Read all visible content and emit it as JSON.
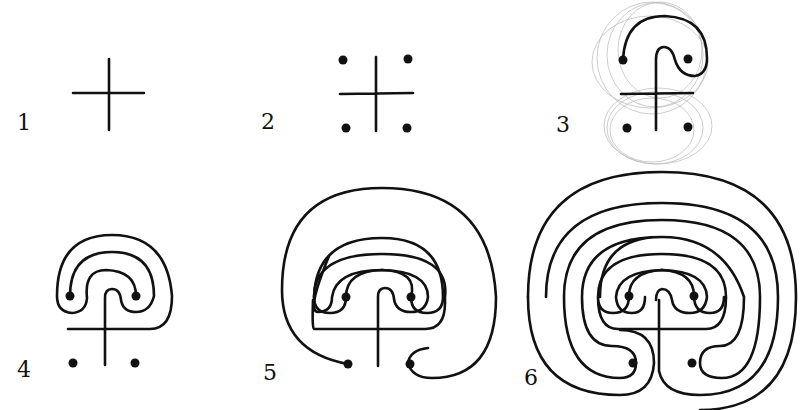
{
  "figure": {
    "ink_color": "#111111",
    "sketch_color": "#b8b8b8",
    "background": "#ffffff"
  },
  "steps": [
    {
      "number": "1",
      "description": "cross"
    },
    {
      "number": "2",
      "description": "cross with four corner dots"
    },
    {
      "number": "3",
      "description": "first loops connecting top of cross and dots (with faint pencil guide circles)"
    },
    {
      "number": "4",
      "description": "three nested arcs over the seed pattern"
    },
    {
      "number": "5",
      "description": "five circuits with outer arc connecting to lower dots"
    },
    {
      "number": "6",
      "description": "completed seven-circuit labyrinth"
    }
  ]
}
